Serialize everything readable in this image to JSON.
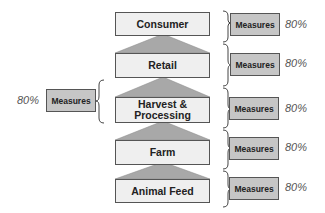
{
  "colors": {
    "stage_fill": "#efefef",
    "measures_fill": "#c6c6c6",
    "triangle_fill": "#a8a8a8",
    "border": "#555555"
  },
  "stages": [
    {
      "label": "Consumer",
      "measures": "Measures",
      "percent": "80%"
    },
    {
      "label": "Retail",
      "measures": "Measures",
      "percent": "80%"
    },
    {
      "label": "Harvest & Processing",
      "measures": "Measures",
      "percent": "80%"
    },
    {
      "label": "Farm",
      "measures": "Measures",
      "percent": "80%"
    },
    {
      "label": "Animal Feed",
      "measures": "Measures",
      "percent": "80%"
    }
  ],
  "left_measure": {
    "label": "Measures",
    "percent": "80%"
  }
}
